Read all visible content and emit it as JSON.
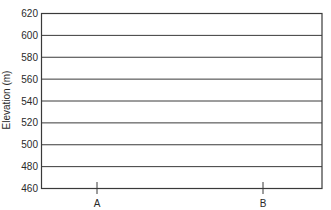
{
  "chart_data": {
    "type": "line",
    "title": "",
    "xlabel": "",
    "ylabel": "Elevation (m)",
    "ylim": [
      460,
      620
    ],
    "yticks": [
      460,
      480,
      500,
      520,
      540,
      560,
      580,
      600,
      620
    ],
    "x_markers": [
      "A",
      "B"
    ],
    "grid": true,
    "series": []
  },
  "axis": {
    "ylabel": "Elevation (m)",
    "marker_a": "A",
    "marker_b": "B"
  },
  "colors": {
    "line": "#3a3a3a",
    "text": "#2a2a2a",
    "background": "#ffffff"
  }
}
